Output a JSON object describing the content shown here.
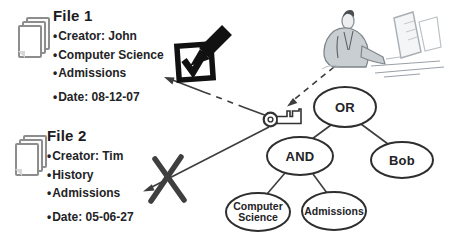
{
  "figure": {
    "bullet_char": "•",
    "files": [
      {
        "title": "File 1",
        "items": [
          "Creator: John",
          "Computer Science",
          "Admissions",
          "Date: 08-12-07"
        ]
      },
      {
        "title": "File 2",
        "items": [
          "Creator: Tim",
          "History",
          "Admissions",
          "Date: 05-06-27"
        ]
      }
    ],
    "policy_tree": {
      "or": "OR",
      "and": "AND",
      "bob": "Bob",
      "computer_science": "Computer Science",
      "admissions": "Admissions"
    },
    "icons": {
      "document": "document-stack-icon",
      "access_granted": "checkbox-checked-marker-icon",
      "access_denied": "x-mark-icon",
      "key": "key-icon",
      "user": "person-at-computer-icon"
    },
    "colors": {
      "ink": "#1d1d1f",
      "line": "#3d3d3d",
      "x_mark": "#3f3f3f",
      "icon_black": "#111111",
      "sketch_gray": "#9aa0a6"
    }
  }
}
